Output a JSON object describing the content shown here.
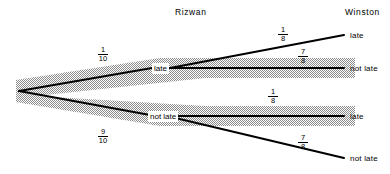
{
  "diagram": {
    "type": "probability-tree",
    "title": "",
    "stage_headers": [
      {
        "label": "Rizwan",
        "x": 175,
        "y": 8
      },
      {
        "label": "Winston",
        "x": 345,
        "y": 8
      }
    ],
    "root": {
      "x": 18,
      "y": 91
    },
    "level1": [
      {
        "id": "rizwan-late",
        "label": "late",
        "probability": {
          "numerator": "1",
          "denominator": "10"
        },
        "prob_x": 96,
        "prob_y": 46,
        "node_x": 152,
        "node_y": 68,
        "highlighted": true
      },
      {
        "id": "rizwan-not-late",
        "label": "not late",
        "probability": {
          "numerator": "9",
          "denominator": "10"
        },
        "prob_x": 96,
        "prob_y": 128,
        "node_x": 148,
        "node_y": 114,
        "highlighted": true
      }
    ],
    "level2": [
      {
        "id": "winston-late-1",
        "parent": "rizwan-late",
        "label": "late",
        "probability": {
          "numerator": "1",
          "denominator": "8"
        },
        "prob_x": 276,
        "prob_y": 28,
        "leaf_x": 350,
        "leaf_y": 35,
        "highlighted": false
      },
      {
        "id": "winston-not-late-1",
        "parent": "rizwan-late",
        "label": "not late",
        "probability": {
          "numerator": "7",
          "denominator": "8"
        },
        "prob_x": 296,
        "prob_y": 50,
        "leaf_x": 350,
        "leaf_y": 73,
        "highlighted": true
      },
      {
        "id": "winston-late-2",
        "parent": "rizwan-not-late",
        "label": "late",
        "probability": {
          "numerator": "1",
          "denominator": "8"
        },
        "prob_x": 266,
        "prob_y": 90,
        "leaf_x": 350,
        "leaf_y": 118,
        "highlighted": true
      },
      {
        "id": "winston-not-late-2",
        "parent": "rizwan-not-late",
        "label": "not late",
        "probability": {
          "numerator": "7",
          "denominator": "8"
        },
        "prob_x": 296,
        "prob_y": 136,
        "leaf_x": 350,
        "leaf_y": 158,
        "highlighted": false
      }
    ],
    "colors": {
      "line": "#000000",
      "text": "#000000",
      "background": "#ffffff",
      "hatch": "#8c8c8c"
    }
  }
}
